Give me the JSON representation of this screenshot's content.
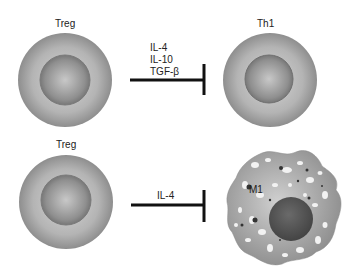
{
  "top_row": {
    "source_cell": {
      "label": "Treg"
    },
    "cytokines": [
      "IL-4",
      "IL-10",
      "TGF-β"
    ],
    "target_cell": {
      "label": "Th1"
    },
    "interaction": "inhibition"
  },
  "bottom_row": {
    "source_cell": {
      "label": "Treg"
    },
    "cytokines": [
      "IL-4"
    ],
    "target_cell": {
      "label": "M1"
    },
    "interaction": "inhibition"
  },
  "colors": {
    "cell_outer": "#a8a8a8",
    "cell_nucleus": "#8a8a8a",
    "inhibition_line": "#111111",
    "macrophage_nucleus": "#555555"
  }
}
